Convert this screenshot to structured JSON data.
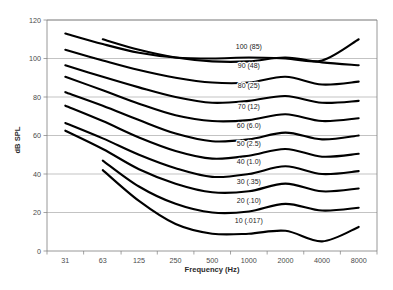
{
  "chart_data": {
    "type": "line",
    "title": "",
    "xlabel": "Frequency (Hz)",
    "ylabel": "dB SPL",
    "xscale": "log",
    "xticklabels": [
      "31",
      "63",
      "125",
      "250",
      "500",
      "1000",
      "2000",
      "4000",
      "8000"
    ],
    "xtickvalues": [
      31,
      63,
      125,
      250,
      500,
      1000,
      2000,
      4000,
      8000
    ],
    "yticklabels": [
      "0",
      "20",
      "40",
      "60",
      "80",
      "100",
      "120"
    ],
    "ytickvalues": [
      0,
      20,
      40,
      60,
      80,
      100,
      120
    ],
    "ylim": [
      0,
      120
    ],
    "grid": "horizontal",
    "legend": "inline-curve-labels",
    "x": [
      31,
      63,
      125,
      250,
      500,
      1000,
      2000,
      4000,
      8000
    ],
    "series": [
      {
        "name": "110 phon",
        "label": "",
        "values": [
          113.0,
          107.5,
          103.0,
          100.5,
          100.0,
          100.5,
          100.0,
          99.0,
          110.0
        ],
        "x_start": 31
      },
      {
        "name": "100 phon",
        "label": "100 (85)",
        "label_x": 1000,
        "label_y": 105.0,
        "values": [
          null,
          110.0,
          104.5,
          100.5,
          98.5,
          98.5,
          100.5,
          98.0,
          96.5
        ],
        "x_start": 63
      },
      {
        "name": "90 phon",
        "label": "90 (48)",
        "label_x": 1000,
        "label_y": 95.0,
        "values": [
          104.5,
          99.0,
          94.0,
          90.0,
          87.5,
          87.5,
          90.5,
          86.5,
          88.0
        ],
        "x_start": 31
      },
      {
        "name": "80 phon",
        "label": "80 (25)",
        "label_x": 1000,
        "label_y": 84.5,
        "values": [
          96.5,
          90.5,
          85.0,
          80.0,
          77.0,
          78.0,
          80.5,
          77.0,
          78.0
        ],
        "x_start": 31
      },
      {
        "name": "70 phon",
        "label": "70 (12)",
        "label_x": 1000,
        "label_y": 74.0,
        "values": [
          90.5,
          83.5,
          76.5,
          70.5,
          67.5,
          68.0,
          71.0,
          67.5,
          69.0
        ],
        "x_start": 31
      },
      {
        "name": "60 phon",
        "label": "60 (6.0)",
        "label_x": 1000,
        "label_y": 64.0,
        "values": [
          82.5,
          75.5,
          68.0,
          61.0,
          57.0,
          58.0,
          61.5,
          58.0,
          60.0
        ],
        "x_start": 31
      },
      {
        "name": "50 phon",
        "label": "50 (2.5)",
        "label_x": 1000,
        "label_y": 54.5,
        "values": [
          75.5,
          67.5,
          59.0,
          52.0,
          48.0,
          49.5,
          53.0,
          49.0,
          50.5
        ],
        "x_start": 31
      },
      {
        "name": "40 phon",
        "label": "40 (1.0)",
        "label_x": 1000,
        "label_y": 45.0,
        "values": [
          66.5,
          58.5,
          50.0,
          43.0,
          38.5,
          40.0,
          44.0,
          40.0,
          41.5
        ],
        "x_start": 31
      },
      {
        "name": "30 phon",
        "label": "30 (.35)",
        "label_x": 1000,
        "label_y": 35.0,
        "values": [
          62.5,
          53.0,
          42.5,
          35.0,
          30.5,
          31.0,
          35.0,
          31.0,
          32.5
        ],
        "x_start": 31
      },
      {
        "name": "20 phon",
        "label": "20 (.10)",
        "label_x": 1000,
        "label_y": 25.0,
        "values": [
          null,
          47.0,
          33.5,
          24.5,
          20.0,
          20.5,
          24.5,
          21.0,
          22.5
        ],
        "x_start": 63
      },
      {
        "name": "10 phon",
        "label": "10 (.017)",
        "label_x": 1000,
        "label_y": 14.5,
        "values": [
          null,
          42.0,
          26.0,
          14.0,
          9.0,
          9.0,
          10.5,
          5.0,
          12.5
        ],
        "x_start": 63
      }
    ]
  },
  "axes": {
    "x_title": "Frequency (Hz)",
    "y_title": "dB SPL"
  }
}
